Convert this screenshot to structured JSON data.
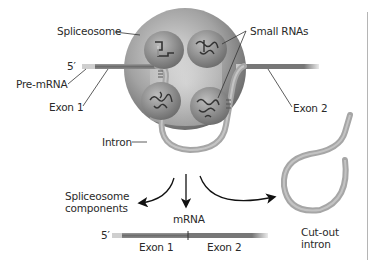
{
  "diagram": {
    "labels": {
      "spliceosome": "Spliceosome",
      "small_rnas": "Small RNAs",
      "five_prime_top": "5′",
      "pre_mrna": "Pre-mRNA",
      "exon1_top": "Exon 1",
      "exon2_top": "Exon 2",
      "intron": "Intron",
      "spliceosome_components_line1": "Spliceosome",
      "spliceosome_components_line2": "components",
      "mrna": "mRNA",
      "five_prime_bottom": "5′",
      "exon1_bottom": "Exon 1",
      "exon2_bottom": "Exon 2",
      "cut_out_intron_line1": "Cut-out",
      "cut_out_intron_line2": "intron"
    },
    "nodes": [
      {
        "id": "spliceosome",
        "shape": "sphere",
        "contains": [
          "small-rna-1",
          "small-rna-2",
          "small-rna-3",
          "small-rna-4"
        ]
      },
      {
        "id": "pre-mrna",
        "parts": [
          "5-prime-cap",
          "exon-1",
          "intron",
          "exon-2"
        ]
      },
      {
        "id": "spliceosome-components"
      },
      {
        "id": "mrna",
        "parts": [
          "5-prime-cap",
          "exon-1",
          "exon-2"
        ]
      },
      {
        "id": "cut-out-intron",
        "shape": "lariat"
      }
    ],
    "edges": [
      {
        "from": "spliceosome",
        "to": "spliceosome-components",
        "type": "arrow"
      },
      {
        "from": "spliceosome",
        "to": "mrna",
        "type": "arrow"
      },
      {
        "from": "spliceosome",
        "to": "cut-out-intron",
        "type": "arrow"
      }
    ],
    "colors": {
      "sphere_dark": "#6e6e6e",
      "sphere_light": "#c8c8c8",
      "exon": "#7a7a7a",
      "cap": "#cfcfcf",
      "intron": "#a9a9a9",
      "arrow": "#111111",
      "text": "#2a2a2a"
    }
  }
}
